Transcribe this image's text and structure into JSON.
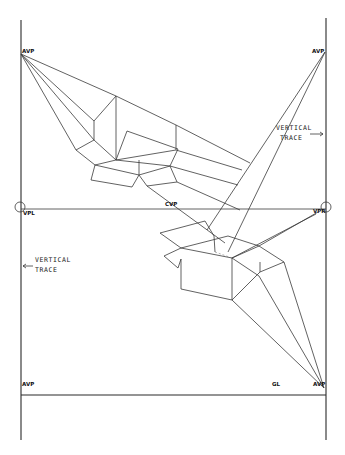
{
  "labels": {
    "avp_top_left": "AVP",
    "avp_top_right": "AVP",
    "avp_bottom_left": "AVP",
    "avp_bottom_right": "AVP",
    "vpl": "VPL",
    "vpr": "VPR",
    "cvp": "CVP",
    "gl": "GL",
    "vertical_trace_right_line1": "VERTICAL",
    "vertical_trace_right_line2": "TRACE",
    "vertical_trace_left_line1": "VERTICAL",
    "vertical_trace_left_line2": "TRACE"
  },
  "colors": {
    "ink": "#3a3a3a",
    "paper": "#ffffff"
  }
}
